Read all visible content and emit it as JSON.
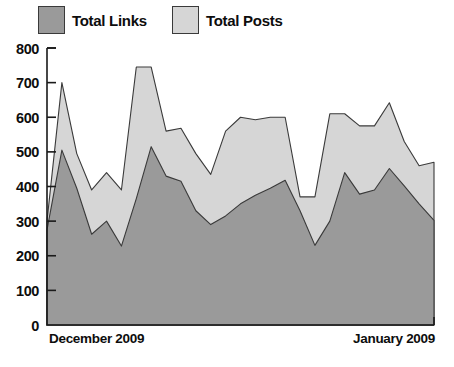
{
  "legend": {
    "items": [
      {
        "key": "links",
        "label": "Total Links",
        "color": "#9a9a9a"
      },
      {
        "key": "posts",
        "label": "Total Posts",
        "color": "#d6d6d6"
      }
    ]
  },
  "axis": {
    "y_ticks": [
      "800",
      "700",
      "600",
      "500",
      "400",
      "300",
      "200",
      "100",
      "0"
    ],
    "x_left_label": "December 2009",
    "x_right_label": "January 2009"
  },
  "chart_data": {
    "type": "area",
    "stacked": true,
    "title": "",
    "xlabel": "",
    "ylabel": "",
    "ylim": [
      0,
      800
    ],
    "ygrid": false,
    "legend_position": "top-left",
    "x": [
      1,
      2,
      3,
      4,
      5,
      6,
      7,
      8,
      9,
      10,
      11,
      12,
      13,
      14,
      15,
      16,
      17,
      18,
      19,
      20,
      21,
      22,
      23,
      24,
      25,
      26,
      27
    ],
    "x_tick_labels": [
      "December 2009",
      "January 2009"
    ],
    "series": [
      {
        "name": "Total Links",
        "color": "#9a9a9a",
        "values": [
          275,
          505,
          395,
          262,
          300,
          228,
          365,
          515,
          430,
          415,
          330,
          290,
          315,
          350,
          375,
          395,
          418,
          330,
          230,
          300,
          440,
          378,
          390,
          452,
          402,
          350,
          302
        ]
      },
      {
        "name": "Total Posts",
        "color": "#d6d6d6",
        "values": [
          25,
          195,
          100,
          128,
          140,
          162,
          380,
          230,
          130,
          153,
          165,
          145,
          245,
          250,
          218,
          205,
          182,
          40,
          140,
          310,
          170,
          197,
          185,
          190,
          128,
          110,
          168
        ]
      }
    ],
    "totals": [
      300,
      700,
      495,
      390,
      440,
      390,
      745,
      745,
      560,
      568,
      495,
      435,
      560,
      600,
      593,
      600,
      600,
      370,
      370,
      610,
      610,
      575,
      575,
      642,
      530,
      460,
      470
    ]
  }
}
